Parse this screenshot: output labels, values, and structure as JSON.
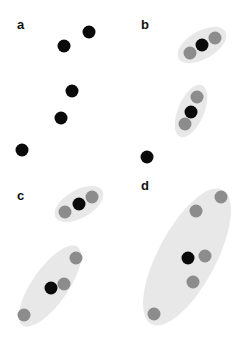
{
  "colors": {
    "cluster_fill": "#e8e8e8",
    "point_black": "#0a0a0a",
    "point_gray": "#8c8c8c",
    "label": "#111111"
  },
  "point_radius": 6.5,
  "panels": [
    {
      "label": "a",
      "label_pos": [
        17,
        29
      ],
      "clusters": [],
      "points": [
        {
          "x": 89,
          "y": 32,
          "type": "black"
        },
        {
          "x": 64,
          "y": 46,
          "type": "black"
        },
        {
          "x": 72,
          "y": 91,
          "type": "black"
        },
        {
          "x": 61,
          "y": 118,
          "type": "black"
        },
        {
          "x": 22,
          "y": 150,
          "type": "black"
        }
      ]
    },
    {
      "label": "b",
      "label_pos": [
        141,
        29
      ],
      "clusters": [
        {
          "cx": 202,
          "cy": 45,
          "rx": 27,
          "ry": 14,
          "angle": -30
        },
        {
          "cx": 191,
          "cy": 111,
          "rx": 28,
          "ry": 13,
          "angle": -67
        }
      ],
      "points": [
        {
          "x": 190,
          "y": 53,
          "type": "gray"
        },
        {
          "x": 215,
          "y": 38,
          "type": "gray"
        },
        {
          "x": 202,
          "y": 45,
          "type": "black"
        },
        {
          "x": 197,
          "y": 97,
          "type": "gray"
        },
        {
          "x": 185,
          "y": 124,
          "type": "gray"
        },
        {
          "x": 191,
          "y": 112,
          "type": "black"
        },
        {
          "x": 147,
          "y": 157,
          "type": "black"
        }
      ]
    },
    {
      "label": "c",
      "label_pos": [
        17,
        200
      ],
      "clusters": [
        {
          "cx": 79,
          "cy": 204,
          "rx": 27,
          "ry": 14,
          "angle": -30
        },
        {
          "cx": 50,
          "cy": 286,
          "rx": 48,
          "ry": 18,
          "angle": -55
        }
      ],
      "points": [
        {
          "x": 65,
          "y": 212,
          "type": "gray"
        },
        {
          "x": 92,
          "y": 197,
          "type": "gray"
        },
        {
          "x": 79,
          "y": 204,
          "type": "black"
        },
        {
          "x": 76,
          "y": 258,
          "type": "gray"
        },
        {
          "x": 64,
          "y": 284,
          "type": "gray"
        },
        {
          "x": 24,
          "y": 315,
          "type": "gray"
        },
        {
          "x": 51,
          "y": 288,
          "type": "black"
        }
      ]
    },
    {
      "label": "d",
      "label_pos": [
        141,
        190
      ],
      "clusters": [
        {
          "cx": 187,
          "cy": 257,
          "rx": 76,
          "ry": 29,
          "angle": -62
        }
      ],
      "points": [
        {
          "x": 221,
          "y": 197,
          "type": "gray"
        },
        {
          "x": 196,
          "y": 211,
          "type": "gray"
        },
        {
          "x": 205,
          "y": 256,
          "type": "gray"
        },
        {
          "x": 193,
          "y": 282,
          "type": "gray"
        },
        {
          "x": 154,
          "y": 314,
          "type": "gray"
        },
        {
          "x": 188,
          "y": 258,
          "type": "black"
        }
      ]
    }
  ]
}
